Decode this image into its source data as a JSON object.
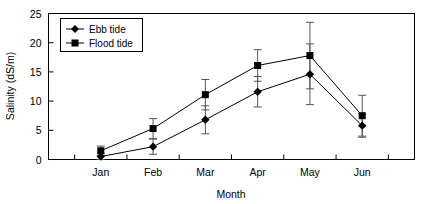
{
  "chart_data": {
    "type": "line",
    "title": "",
    "xlabel": "Month",
    "ylabel": "Salinity (dS/m)",
    "categories": [
      "Jan",
      "Feb",
      "Mar",
      "Apr",
      "May",
      "Jun"
    ],
    "ylim": [
      0,
      25
    ],
    "yticks": [
      0,
      5,
      10,
      15,
      20,
      25
    ],
    "ytick_labels": [
      "0",
      "5",
      "10",
      "15",
      "20",
      "25"
    ],
    "grid": false,
    "legend_position": "top-left",
    "error_bars": "symmetric",
    "series": [
      {
        "name": "Ebb tide",
        "marker": "diamond",
        "color": "#000000",
        "values": [
          0.5,
          2.2,
          6.8,
          11.6,
          14.6,
          5.8
        ],
        "errors": [
          0.6,
          1.3,
          2.4,
          2.6,
          5.2,
          2.0
        ]
      },
      {
        "name": "Flood tide",
        "marker": "square",
        "color": "#000000",
        "values": [
          1.5,
          5.3,
          11.1,
          16.1,
          17.8,
          7.5
        ],
        "errors": [
          0.8,
          1.7,
          2.6,
          2.7,
          5.7,
          3.5
        ]
      }
    ]
  },
  "legend": {
    "entries": [
      {
        "label": "Ebb tide",
        "marker": "diamond"
      },
      {
        "label": "Flood tide",
        "marker": "square"
      }
    ]
  },
  "axes": {
    "y_title": "Salinity (dS/m)",
    "x_title": "Month"
  }
}
